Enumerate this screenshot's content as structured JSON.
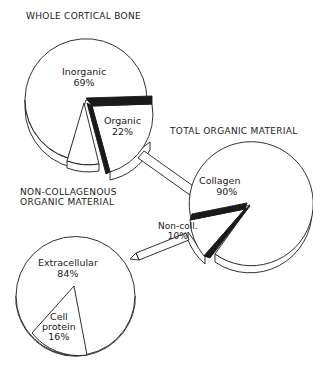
{
  "diagram": {
    "pies": [
      {
        "title": "WHOLE CORTICAL BONE",
        "slices": [
          {
            "label": "Inorganic",
            "value": "69%"
          },
          {
            "label": "Organic",
            "value": "22%"
          },
          {
            "label": "",
            "value": ""
          }
        ]
      },
      {
        "title": "TOTAL ORGANIC MATERIAL",
        "slices": [
          {
            "label": "Collagen",
            "value": "90%"
          },
          {
            "label": "Non-coll.",
            "value": "10%"
          }
        ]
      },
      {
        "title_line1": "NON-COLLAGENOUS",
        "title_line2": "ORGANIC MATERIAL",
        "slices": [
          {
            "label": "Extracellular",
            "value": "84%"
          },
          {
            "label_line1": "Cell",
            "label_line2": "protein",
            "value": "16%"
          }
        ]
      }
    ],
    "connectors": [
      {
        "from": "Organic 22%",
        "to": "TOTAL ORGANIC MATERIAL"
      },
      {
        "from": "Non-coll. 10%",
        "to": "NON-COLLAGENOUS ORGANIC MATERIAL"
      }
    ],
    "colors": {
      "line": "#1a1a1a",
      "fill": "#ffffff"
    }
  }
}
